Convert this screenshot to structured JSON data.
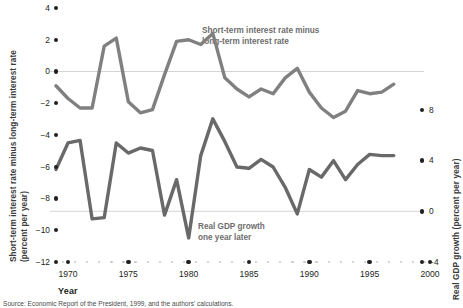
{
  "chart_data": {
    "type": "line",
    "title": "",
    "xlabel": "Year",
    "ylabel_left": "Short-term interest rate minus long-term interest rate (percent per year)",
    "ylabel_right": "Real GDP growth (percent per year)",
    "xlim": [
      1969,
      2000
    ],
    "ylim_left": [
      -12,
      4
    ],
    "ylim_right": [
      -4,
      10
    ],
    "grid": false,
    "legend_position": "inline-annotations",
    "left_axis_ticks": [
      "4",
      "2",
      "0",
      "-2",
      "-4",
      "-6",
      "-8",
      "-10",
      "-12"
    ],
    "right_axis_ticks": [
      "8",
      "4",
      "0",
      "-4"
    ],
    "x_ticks": [
      "1970",
      "1975",
      "1980",
      "1985",
      "1990",
      "1995",
      "2000"
    ],
    "annotations": [
      {
        "id": "spread",
        "line1": "Short-term interest rate minus",
        "line2": "long-term interest rate"
      },
      {
        "id": "gdp",
        "line1": "Real GDP growth",
        "line2": "one year later"
      }
    ],
    "series": [
      {
        "name": "Short-term interest rate minus long-term interest rate",
        "axis": "left",
        "color": "#808080",
        "x": [
          1969,
          1970,
          1971,
          1972,
          1973,
          1974,
          1975,
          1976,
          1977,
          1978,
          1979,
          1980,
          1981,
          1982,
          1983,
          1984,
          1985,
          1986,
          1987,
          1988,
          1989,
          1990,
          1991,
          1992,
          1993,
          1994,
          1995,
          1996,
          1997
        ],
        "values": [
          -0.9,
          -1.7,
          -2.3,
          -2.3,
          1.6,
          2.1,
          -1.9,
          -2.6,
          -2.4,
          -0.2,
          1.9,
          2.0,
          1.7,
          2.4,
          -0.4,
          -1.1,
          -1.6,
          -1.1,
          -1.4,
          -0.4,
          0.2,
          -1.3,
          -2.3,
          -2.9,
          -2.5,
          -1.2,
          -1.4,
          -1.3,
          -0.8
        ]
      },
      {
        "name": "Real GDP growth one year later",
        "axis": "right",
        "color": "#696969",
        "x": [
          1969,
          1970,
          1971,
          1972,
          1973,
          1974,
          1975,
          1976,
          1977,
          1978,
          1979,
          1980,
          1981,
          1982,
          1983,
          1984,
          1985,
          1986,
          1987,
          1988,
          1989,
          1990,
          1991,
          1992,
          1993,
          1994,
          1995,
          1996,
          1997
        ],
        "values": [
          3.3,
          5.4,
          5.6,
          -0.6,
          -0.5,
          5.4,
          4.6,
          5.0,
          4.8,
          -0.3,
          2.5,
          -2.1,
          4.4,
          7.3,
          5.5,
          3.5,
          3.4,
          4.1,
          3.5,
          1.9,
          -0.2,
          3.3,
          2.7,
          4.0,
          2.5,
          3.7,
          4.5,
          4.4,
          4.4
        ]
      }
    ]
  },
  "source": {
    "text": "Source:  Economic Report of the President, 1999, and the authors' calculations."
  }
}
